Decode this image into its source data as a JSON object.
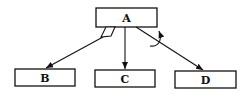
{
  "diagram": {
    "type": "tree",
    "nodes": [
      {
        "id": "A",
        "label": "A",
        "x": 96,
        "y": 8,
        "w": 61,
        "h": 19
      },
      {
        "id": "B",
        "label": "B",
        "x": 15,
        "y": 69,
        "w": 60,
        "h": 17
      },
      {
        "id": "C",
        "label": "C",
        "x": 95,
        "y": 70,
        "w": 60,
        "h": 17
      },
      {
        "id": "D",
        "label": "D",
        "x": 175,
        "y": 71,
        "w": 61,
        "h": 17
      }
    ],
    "edges": [
      {
        "from": "A",
        "to": "B",
        "annotation": "parallelogram-marker"
      },
      {
        "from": "A",
        "to": "C"
      },
      {
        "from": "A",
        "to": "D",
        "annotation": "curved-arrow"
      }
    ],
    "colors": {
      "stroke": "#111111",
      "background": "#ffffff"
    }
  }
}
